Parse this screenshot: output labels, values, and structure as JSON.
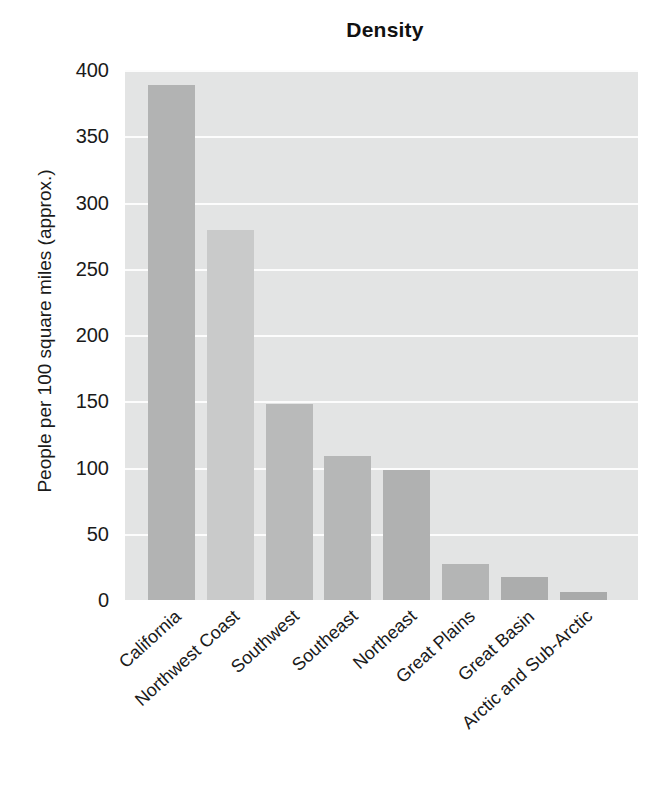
{
  "chart_data": {
    "type": "bar",
    "title": "Density",
    "xlabel": "",
    "ylabel": "People per 100 square miles (approx.)",
    "categories": [
      "California",
      "Northwest Coast",
      "Southwest",
      "Southeast",
      "Northeast",
      "Great Plains",
      "Great Basin",
      "Arctic and Sub-Arctic"
    ],
    "values": [
      389,
      279,
      148,
      109,
      98,
      27,
      17,
      6
    ],
    "ylim": [
      0,
      400
    ],
    "yticks": [
      0,
      50,
      100,
      150,
      200,
      250,
      300,
      350,
      400
    ],
    "ytick_labels": [
      "0",
      "50",
      "100",
      "150",
      "200",
      "250",
      "300",
      "350",
      "400"
    ],
    "grid": true,
    "grid_axis": "y",
    "grid_color": "#fcfcfc",
    "legend": false,
    "plot_background": "#e3e4e4",
    "figure_background": "#ffffff",
    "bar_colors": [
      "#b2b3b3",
      "#c9caca",
      "#b9baba",
      "#b6b7b7",
      "#b0b1b1",
      "#b4b5b5",
      "#acadad",
      "#a9aaaa"
    ]
  }
}
